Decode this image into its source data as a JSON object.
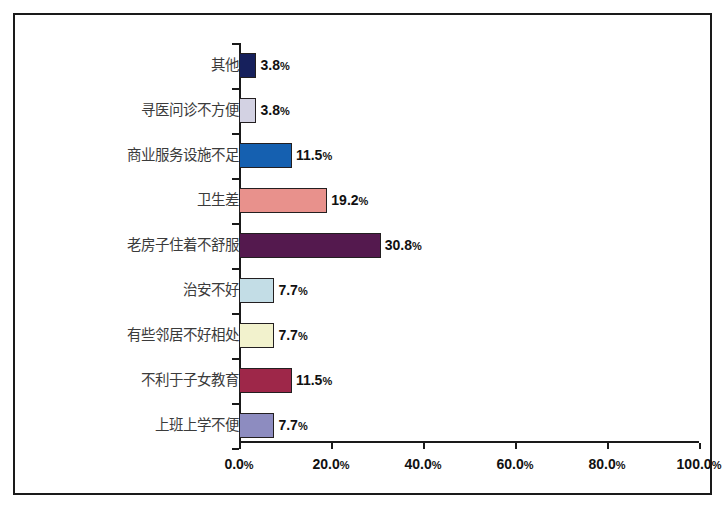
{
  "chart_data": {
    "type": "bar",
    "orientation": "horizontal",
    "title": "",
    "xlabel": "",
    "ylabel": "",
    "xlim": [
      0,
      100
    ],
    "grid": false,
    "legend": false,
    "axis_tick_labels": [
      "0.0%",
      "20.0%",
      "40.0%",
      "60.0%",
      "80.0%",
      "100.0%"
    ],
    "axis_tick_values": [
      0,
      20,
      40,
      60,
      80,
      100
    ],
    "categories": [
      "其他",
      "寻医问诊不方便",
      "商业服务设施不足",
      "卫生差",
      "老房子住着不舒服",
      "治安不好",
      "有些邻居不好相处",
      "不利于子女教育",
      "上班上学不便"
    ],
    "values": [
      3.8,
      3.8,
      11.5,
      19.2,
      30.8,
      7.7,
      7.7,
      11.5,
      7.7
    ],
    "value_labels": [
      "3.8%",
      "3.8%",
      "11.5%",
      "19.2%",
      "30.8%",
      "7.7%",
      "7.7%",
      "11.5%",
      "7.7%"
    ],
    "bar_colors": [
      "#16205c",
      "#d3d2e3",
      "#1560b0",
      "#e8918c",
      "#54194e",
      "#c3dde6",
      "#f2f2cd",
      "#9e2749",
      "#8d8cc0"
    ],
    "bar_border_color": "#231f20"
  }
}
